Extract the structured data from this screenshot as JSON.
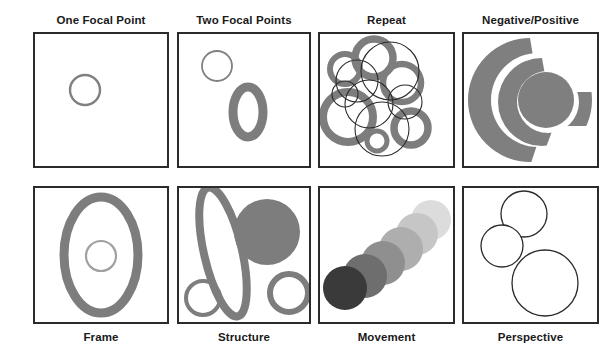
{
  "document": {
    "title": "Circle Composition Principles Chart",
    "background_color": "#ffffff",
    "stroke_color": "#2b2b2b",
    "accent_gray": "#7f7f7f"
  },
  "grid": {
    "columns": 4,
    "rows": 2
  },
  "panels": [
    {
      "id": "one-focal-point",
      "label": "One Focal Point",
      "label_position": "top",
      "column": 0,
      "row": 0,
      "description": "A single small gray outlined circle centered in the frame.",
      "shapes": [
        {
          "type": "circle",
          "cx": 50,
          "cy": 56,
          "r": 15,
          "fill": "none",
          "stroke": "#808080",
          "stroke_width": 2.4
        }
      ]
    },
    {
      "id": "two-focal-points",
      "label": "Two Focal Points",
      "label_position": "top",
      "column": 1,
      "row": 0,
      "description": "A thin outlined circle upper-left and a thick gray ellipse ring lower-right.",
      "shapes": [
        {
          "type": "circle",
          "cx": 38,
          "cy": 32,
          "r": 15,
          "fill": "none",
          "stroke": "#808080",
          "stroke_width": 1.8
        },
        {
          "type": "ellipse",
          "cx": 69,
          "cy": 78,
          "rx": 15,
          "ry": 25,
          "fill": "none",
          "stroke": "#7d7d7d",
          "stroke_width": 9
        }
      ]
    },
    {
      "id": "repeat",
      "label": "Repeat",
      "label_position": "top",
      "column": 2,
      "row": 0,
      "description": "Seven thick gray rings clustered and overlapped by six thin black outlined circles.",
      "gray_rings": [
        {
          "cx": 54,
          "cy": 24,
          "r": 19,
          "stroke_width": 7.5
        },
        {
          "cx": 25,
          "cy": 35,
          "r": 15,
          "stroke_width": 6
        },
        {
          "cx": 82,
          "cy": 49,
          "r": 19,
          "stroke_width": 6.5
        },
        {
          "cx": 28,
          "cy": 83,
          "r": 25,
          "stroke_width": 8
        },
        {
          "cx": 91,
          "cy": 94,
          "r": 17,
          "stroke_width": 7.5
        },
        {
          "cx": 57,
          "cy": 107,
          "r": 10,
          "stroke_width": 5
        }
      ],
      "thin_circles": [
        {
          "cx": 37,
          "cy": 47,
          "r": 21
        },
        {
          "cx": 70,
          "cy": 37,
          "r": 29
        },
        {
          "cx": 49,
          "cy": 70,
          "r": 24
        },
        {
          "cx": 62,
          "cy": 95,
          "r": 27
        },
        {
          "cx": 85,
          "cy": 68,
          "r": 17
        },
        {
          "cx": 25,
          "cy": 60,
          "r": 13
        }
      ]
    },
    {
      "id": "negative-positive",
      "label": "Negative/Positive",
      "label_position": "top",
      "column": 3,
      "row": 0,
      "description": "A solid gray spiral made of nested crescents with a filled gray disc at the core.",
      "spiral_color": "#7f7f7f"
    },
    {
      "id": "frame",
      "label": "Frame",
      "label_position": "bottom",
      "column": 0,
      "row": 1,
      "description": "A large thick gray ellipse ring framing a small light gray circle at its center.",
      "shapes": [
        {
          "type": "ellipse",
          "cx": 66,
          "cy": 67,
          "rx": 37,
          "ry": 58,
          "fill": "none",
          "stroke": "#7d7d7d",
          "stroke_width": 9
        },
        {
          "type": "circle",
          "cx": 66,
          "cy": 68,
          "r": 15,
          "fill": "none",
          "stroke": "#a0a0a0",
          "stroke_width": 2.2
        }
      ]
    },
    {
      "id": "structure",
      "label": "Structure",
      "label_position": "bottom",
      "column": 1,
      "row": 1,
      "description": "A tall tilted gray ellipse ring, a large solid gray disc upper-right, and two smaller rings along the bottom.",
      "shapes": [
        {
          "type": "ellipse-rotated",
          "cx": 40,
          "cy": 66,
          "rx": 19,
          "ry": 66,
          "rotate": -13,
          "stroke": "#7d7d7d",
          "stroke_width": 8
        },
        {
          "type": "circle-filled",
          "cx": 88,
          "cy": 44,
          "r": 33,
          "fill": "#7d7d7d"
        },
        {
          "type": "circle",
          "cx": 110,
          "cy": 105,
          "r": 19,
          "stroke": "#7d7d7d",
          "stroke_width": 6
        },
        {
          "type": "circle",
          "cx": 24,
          "cy": 110,
          "r": 17,
          "stroke": "#7d7d7d",
          "stroke_width": 4
        }
      ]
    },
    {
      "id": "movement",
      "label": "Movement",
      "label_position": "bottom",
      "column": 2,
      "row": 1,
      "description": "Six overlapping discs marching diagonally from lower-left to upper-right, fading from near-black to very light gray.",
      "discs": [
        {
          "cx": 25,
          "cy": 100,
          "r": 22,
          "fill": "#3a3a3a"
        },
        {
          "cx": 45,
          "cy": 88,
          "r": 22,
          "fill": "#6e6e6e"
        },
        {
          "cx": 63,
          "cy": 75,
          "r": 22,
          "fill": "#8f8f8f"
        },
        {
          "cx": 81,
          "cy": 61,
          "r": 22,
          "fill": "#aeaeae"
        },
        {
          "cx": 97,
          "cy": 46,
          "r": 21,
          "fill": "#c6c6c6"
        },
        {
          "cx": 111,
          "cy": 32,
          "r": 20,
          "fill": "#dcdcdc"
        }
      ]
    },
    {
      "id": "perspective",
      "label": "Perspective",
      "label_position": "bottom",
      "column": 3,
      "row": 1,
      "description": "Three thin black outlined circles of increasing size descending from top to bottom-right.",
      "shapes": [
        {
          "type": "circle",
          "cx": 60,
          "cy": 26,
          "r": 23,
          "stroke": "#2b2b2b",
          "stroke_width": 1.3
        },
        {
          "type": "circle",
          "cx": 38,
          "cy": 58,
          "r": 21,
          "stroke": "#2b2b2b",
          "stroke_width": 1.3
        },
        {
          "type": "circle",
          "cx": 81,
          "cy": 95,
          "r": 33,
          "stroke": "#2b2b2b",
          "stroke_width": 1.3
        }
      ]
    }
  ]
}
